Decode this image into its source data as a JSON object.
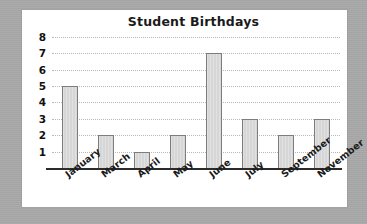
{
  "chart_data": {
    "type": "bar",
    "title": "Student Birthdays",
    "xlabel": "",
    "ylabel": "",
    "categories": [
      "January",
      "March",
      "April",
      "May",
      "June",
      "July",
      "September",
      "November"
    ],
    "values": [
      5,
      2,
      1,
      2,
      7,
      3,
      2,
      3
    ],
    "series": [
      {
        "name": "Student Birthdays",
        "values": [
          5,
          2,
          1,
          2,
          7,
          3,
          2,
          3
        ]
      }
    ],
    "ylim": [
      0,
      8
    ],
    "ytick_labels": [
      "8",
      "7",
      "6",
      "5",
      "4",
      "3",
      "2",
      "1"
    ],
    "ytick_values": [
      8,
      7,
      6,
      5,
      4,
      3,
      2,
      1
    ],
    "grid": true,
    "grid_style": "dotted-horizontal",
    "legend": false,
    "legend_position": "none",
    "bar_fill_color": "#d6d6d6",
    "bar_border_color": "#7d7d7d",
    "gridline_color": "#b8b8b8",
    "axis_color": "#2b2b2b",
    "panel_background": "#ffffff",
    "page_background": "#a9a9a9",
    "title_color": "#1a1a1a",
    "xtick_rotation_degrees": -38
  }
}
